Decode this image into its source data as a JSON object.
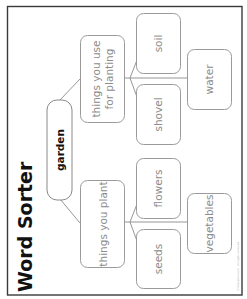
{
  "title": "Word Sorter",
  "root": {
    "label": "garden"
  },
  "categories": [
    {
      "label_lines": [
        "things you use",
        "for planting"
      ],
      "items": [
        "soil",
        "shovel",
        "water"
      ]
    },
    {
      "label_lines": [
        "things you plant"
      ],
      "items": [
        "flowers",
        "seeds",
        "vegetables"
      ]
    }
  ],
  "footer": {
    "copyright": "© Education.com · All rights reserved"
  },
  "colors": {
    "frame": "#3a3a3a",
    "box_stroke": "#9a9a9a",
    "label_text": "#8c8c8c",
    "title_text": "#111111"
  }
}
